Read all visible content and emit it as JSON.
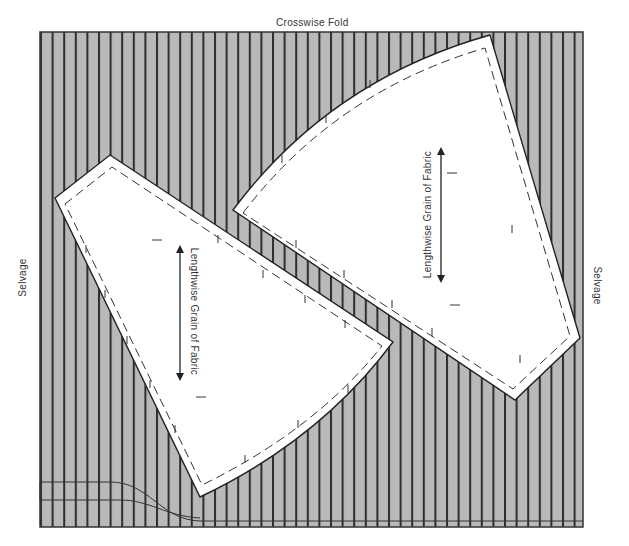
{
  "labels": {
    "top": "Crosswise Fold",
    "left": "Selvage",
    "right": "Selvage",
    "grain_left_piece": "Lengthwise Grain of Fabric",
    "grain_right_piece": "Lengthwise Grain of Fabric"
  },
  "colors": {
    "fabric": "#b9b9b9",
    "stripe": "#2e2e2e",
    "piece": "#ffffff",
    "outline": "#222222"
  },
  "fabric": {
    "x": 40,
    "y": 32,
    "width": 543,
    "height": 495,
    "stripe_spacing": 11.6
  },
  "pieces": [
    {
      "name": "left-pattern-piece",
      "grain_label": "Lengthwise Grain of Fabric"
    },
    {
      "name": "right-pattern-piece",
      "grain_label": "Lengthwise Grain of Fabric"
    }
  ]
}
